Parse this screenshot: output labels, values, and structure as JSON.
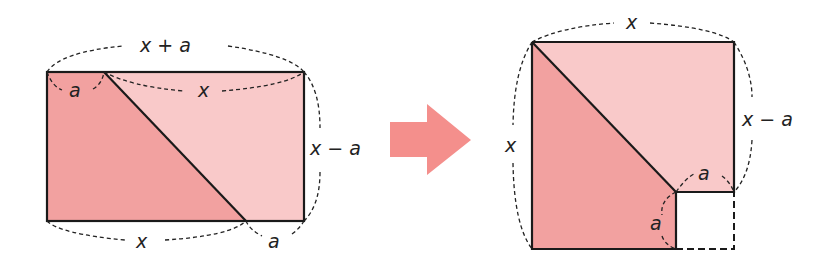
{
  "diagram": {
    "left": {
      "top_label": "x + a",
      "top_left_label": "a",
      "top_right_label": "x",
      "right_label": "x − a",
      "bottom_label": "x",
      "bottom_right_label": "a"
    },
    "right": {
      "top_label": "x",
      "left_label": "x",
      "right_label": "x − a",
      "inner_top_label": "a",
      "inner_left_label": "a"
    },
    "colors": {
      "dark_fill": "#f2a1a0",
      "light_fill": "#f9c9c9",
      "arrow": "#f48f8c",
      "line": "#1a1a1a"
    }
  }
}
